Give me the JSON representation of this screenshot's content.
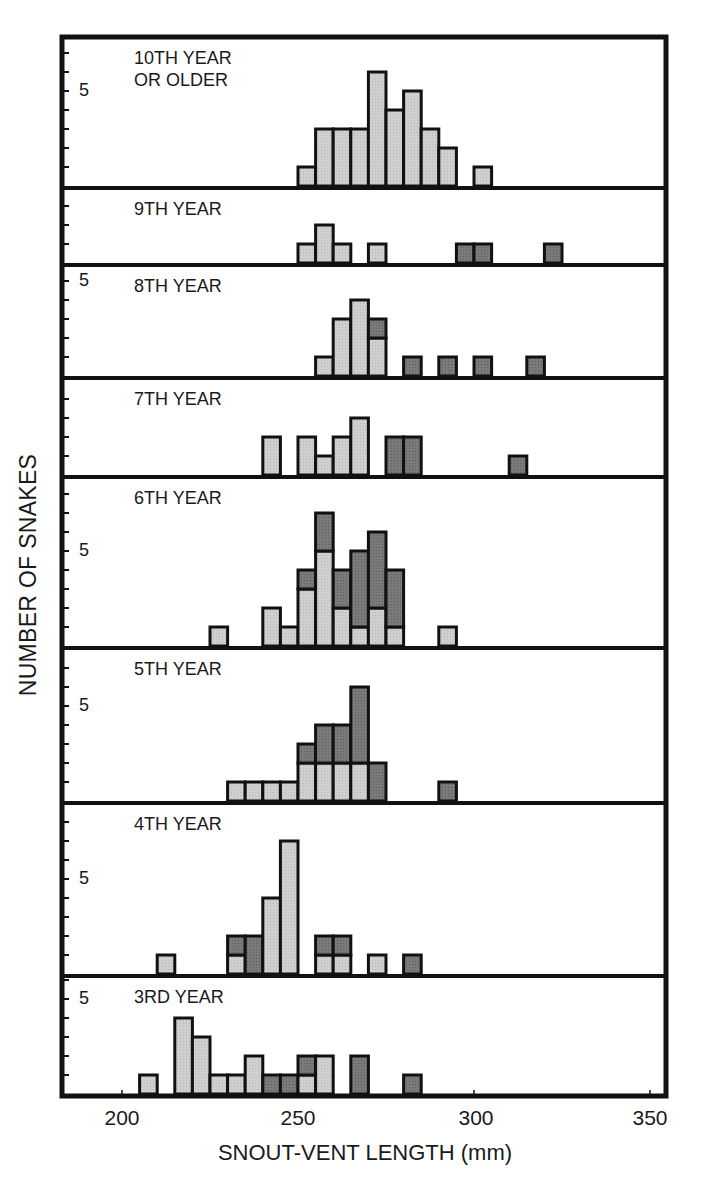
{
  "chart_data": {
    "type": "bar",
    "subtype": "stacked-histogram-small-multiples",
    "title": "",
    "xlabel": "SNOUT-VENT LENGTH (mm)",
    "ylabel": "NUMBER OF SNAKES",
    "xlim": [
      185,
      355
    ],
    "xticks": [
      200,
      250,
      300,
      350
    ],
    "bin_width": 5,
    "y_tick_unit": 1,
    "y_labeled_tick": 5,
    "grid": false,
    "legend": null,
    "colors": {
      "light": "#cfcfcf",
      "dark": "#7a7a7a",
      "edge": "#111111"
    },
    "series_names": [
      "light",
      "dark"
    ],
    "panels": [
      {
        "label": "10TH YEAR\nOR OLDER",
        "ymax": 7.5,
        "five_label_pos": "upper",
        "bins": [
          {
            "x": 250,
            "light": 1,
            "dark": 0
          },
          {
            "x": 255,
            "light": 3,
            "dark": 0
          },
          {
            "x": 260,
            "light": 3,
            "dark": 0
          },
          {
            "x": 265,
            "light": 3,
            "dark": 0
          },
          {
            "x": 270,
            "light": 6,
            "dark": 0
          },
          {
            "x": 275,
            "light": 4,
            "dark": 0
          },
          {
            "x": 280,
            "light": 5,
            "dark": 0
          },
          {
            "x": 285,
            "light": 3,
            "dark": 0
          },
          {
            "x": 290,
            "light": 2,
            "dark": 0
          },
          {
            "x": 300,
            "light": 1,
            "dark": 0
          }
        ]
      },
      {
        "label": "9TH YEAR",
        "ymax": 3.5,
        "five_label_pos": null,
        "bins": [
          {
            "x": 250,
            "light": 1,
            "dark": 0
          },
          {
            "x": 255,
            "light": 2,
            "dark": 0
          },
          {
            "x": 260,
            "light": 1,
            "dark": 0
          },
          {
            "x": 270,
            "light": 1,
            "dark": 0
          },
          {
            "x": 295,
            "light": 0,
            "dark": 1
          },
          {
            "x": 300,
            "light": 0,
            "dark": 1
          },
          {
            "x": 320,
            "light": 0,
            "dark": 1
          }
        ]
      },
      {
        "label": "8TH YEAR",
        "ymax": 5.5,
        "five_label_pos": "top",
        "bins": [
          {
            "x": 255,
            "light": 1,
            "dark": 0
          },
          {
            "x": 260,
            "light": 3,
            "dark": 0
          },
          {
            "x": 265,
            "light": 4,
            "dark": 0
          },
          {
            "x": 270,
            "light": 2,
            "dark": 1
          },
          {
            "x": 280,
            "light": 0,
            "dark": 1
          },
          {
            "x": 290,
            "light": 0,
            "dark": 1
          },
          {
            "x": 300,
            "light": 0,
            "dark": 1
          },
          {
            "x": 315,
            "light": 0,
            "dark": 1
          }
        ]
      },
      {
        "label": "7TH YEAR",
        "ymax": 5,
        "five_label_pos": null,
        "bins": [
          {
            "x": 240,
            "light": 2,
            "dark": 0
          },
          {
            "x": 250,
            "light": 2,
            "dark": 0
          },
          {
            "x": 255,
            "light": 1,
            "dark": 0
          },
          {
            "x": 260,
            "light": 2,
            "dark": 0
          },
          {
            "x": 265,
            "light": 3,
            "dark": 0
          },
          {
            "x": 275,
            "light": 0,
            "dark": 2
          },
          {
            "x": 280,
            "light": 0,
            "dark": 2
          },
          {
            "x": 310,
            "light": 0,
            "dark": 1
          }
        ]
      },
      {
        "label": "6TH YEAR",
        "ymax": 8.5,
        "five_label_pos": "mid",
        "bins": [
          {
            "x": 225,
            "light": 1,
            "dark": 0
          },
          {
            "x": 240,
            "light": 2,
            "dark": 0
          },
          {
            "x": 245,
            "light": 1,
            "dark": 0
          },
          {
            "x": 250,
            "light": 3,
            "dark": 1
          },
          {
            "x": 255,
            "light": 5,
            "dark": 2
          },
          {
            "x": 260,
            "light": 2,
            "dark": 2
          },
          {
            "x": 265,
            "light": 1,
            "dark": 4
          },
          {
            "x": 270,
            "light": 2,
            "dark": 4
          },
          {
            "x": 275,
            "light": 1,
            "dark": 3
          },
          {
            "x": 290,
            "light": 1,
            "dark": 0
          }
        ]
      },
      {
        "label": "5TH YEAR",
        "ymax": 7.8,
        "five_label_pos": "mid",
        "bins": [
          {
            "x": 230,
            "light": 1,
            "dark": 0
          },
          {
            "x": 235,
            "light": 1,
            "dark": 0
          },
          {
            "x": 240,
            "light": 1,
            "dark": 0
          },
          {
            "x": 245,
            "light": 1,
            "dark": 0
          },
          {
            "x": 250,
            "light": 2,
            "dark": 1
          },
          {
            "x": 255,
            "light": 2,
            "dark": 2
          },
          {
            "x": 260,
            "light": 2,
            "dark": 2
          },
          {
            "x": 265,
            "light": 2,
            "dark": 4
          },
          {
            "x": 270,
            "light": 0,
            "dark": 2
          },
          {
            "x": 290,
            "light": 0,
            "dark": 1
          }
        ]
      },
      {
        "label": "4TH YEAR",
        "ymax": 8.5,
        "five_label_pos": "mid",
        "bins": [
          {
            "x": 210,
            "light": 1,
            "dark": 0
          },
          {
            "x": 230,
            "light": 1,
            "dark": 1
          },
          {
            "x": 235,
            "light": 0,
            "dark": 2
          },
          {
            "x": 240,
            "light": 4,
            "dark": 0
          },
          {
            "x": 245,
            "light": 7,
            "dark": 0
          },
          {
            "x": 255,
            "light": 1,
            "dark": 1
          },
          {
            "x": 260,
            "light": 1,
            "dark": 1
          },
          {
            "x": 270,
            "light": 1,
            "dark": 0
          },
          {
            "x": 280,
            "light": 0,
            "dark": 1
          }
        ]
      },
      {
        "label": "3RD YEAR",
        "ymax": 5.2,
        "five_label_pos": "top",
        "bins": [
          {
            "x": 205,
            "light": 1,
            "dark": 0
          },
          {
            "x": 215,
            "light": 4,
            "dark": 0
          },
          {
            "x": 220,
            "light": 3,
            "dark": 0
          },
          {
            "x": 225,
            "light": 1,
            "dark": 0
          },
          {
            "x": 230,
            "light": 1,
            "dark": 0
          },
          {
            "x": 235,
            "light": 2,
            "dark": 0
          },
          {
            "x": 240,
            "light": 0,
            "dark": 1
          },
          {
            "x": 245,
            "light": 0,
            "dark": 1
          },
          {
            "x": 250,
            "light": 1,
            "dark": 1
          },
          {
            "x": 255,
            "light": 2,
            "dark": 0
          },
          {
            "x": 265,
            "light": 0,
            "dark": 2
          },
          {
            "x": 280,
            "light": 0,
            "dark": 1
          }
        ]
      }
    ]
  },
  "labels": {
    "ylabel": "NUMBER OF SNAKES",
    "xlabel": "SNOUT-VENT LENGTH (mm)",
    "xticks": [
      "200",
      "250",
      "300",
      "350"
    ],
    "five": "5"
  }
}
